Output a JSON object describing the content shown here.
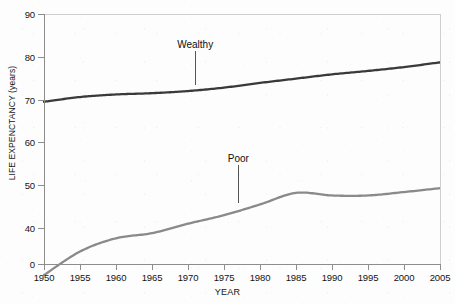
{
  "chart_data": {
    "type": "line",
    "title": "",
    "xlabel": "YEAR",
    "ylabel": "LIFE EXPENCTANCY (years)",
    "xlim": [
      1950,
      2005
    ],
    "ylim": [
      0,
      90
    ],
    "y_axis_broken": true,
    "y_break_note": "axis jumps from 0 directly to 40",
    "yticks": [
      0,
      40,
      50,
      60,
      70,
      80,
      90
    ],
    "ytick_labels": [
      "0",
      "40",
      "50",
      "60",
      "70",
      "80",
      "90"
    ],
    "xticks": [
      1950,
      1955,
      1960,
      1965,
      1970,
      1975,
      1980,
      1985,
      1990,
      1995,
      2000,
      2005
    ],
    "xtick_labels": [
      "1950",
      "1955",
      "1960",
      "1965",
      "1970",
      "1975",
      "1980",
      "1985",
      "1990",
      "1995",
      "2000",
      "2005"
    ],
    "grid": false,
    "legend_position": "inline-annotation",
    "x": [
      1950,
      1955,
      1960,
      1965,
      1970,
      1975,
      1980,
      1985,
      1990,
      1995,
      2000,
      2005
    ],
    "series": [
      {
        "name": "Wealthy",
        "color": "#3a3a3a",
        "values": [
          69.5,
          70.6,
          71.2,
          71.5,
          72.0,
          72.8,
          73.9,
          74.9,
          75.9,
          76.7,
          77.6,
          78.7
        ]
      },
      {
        "name": "Poor",
        "color": "#8a8a8a",
        "values": [
          29.0,
          34.5,
          37.6,
          38.8,
          41.0,
          43.0,
          45.5,
          48.2,
          47.6,
          47.6,
          48.4,
          49.3
        ]
      }
    ],
    "annotations": [
      {
        "text": "Wealthy",
        "x": 1971,
        "y_label": 82.5,
        "y_point": 73.4
      },
      {
        "text": "Poor",
        "x": 1977,
        "y_label": 56.0,
        "y_point": 45.9
      }
    ]
  },
  "axis": {
    "x_title": "YEAR",
    "y_title": "LIFE EXPENCTANCY (years)"
  },
  "colors": {
    "wealthy_line": "#3a3a3a",
    "poor_line": "#8a8a8a",
    "axis": "#8d8d8d",
    "frame": "#cfcfcf",
    "background": "#fdfdfd"
  }
}
